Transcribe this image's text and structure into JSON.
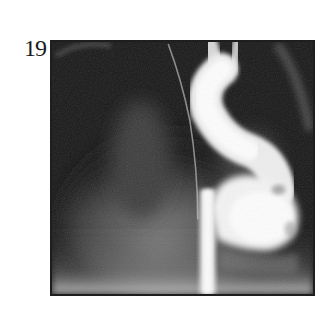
{
  "figure": {
    "label": "19",
    "image_description": "Grayscale contrast radiograph (angiogram/fluoroscopy) showing a bright contrast-filled tubular vessel arching from the top center downward with a bulbous bright region at the lower right, on a dark background with diffuse grey soft tissue shadows and a thin curved catheter line.",
    "colors": {
      "background": "#141414",
      "contrast": "#f4f4f4",
      "soft_tissue": "#7a7a7a",
      "frame_border": "#1e1e1e",
      "page": "#ffffff"
    }
  }
}
